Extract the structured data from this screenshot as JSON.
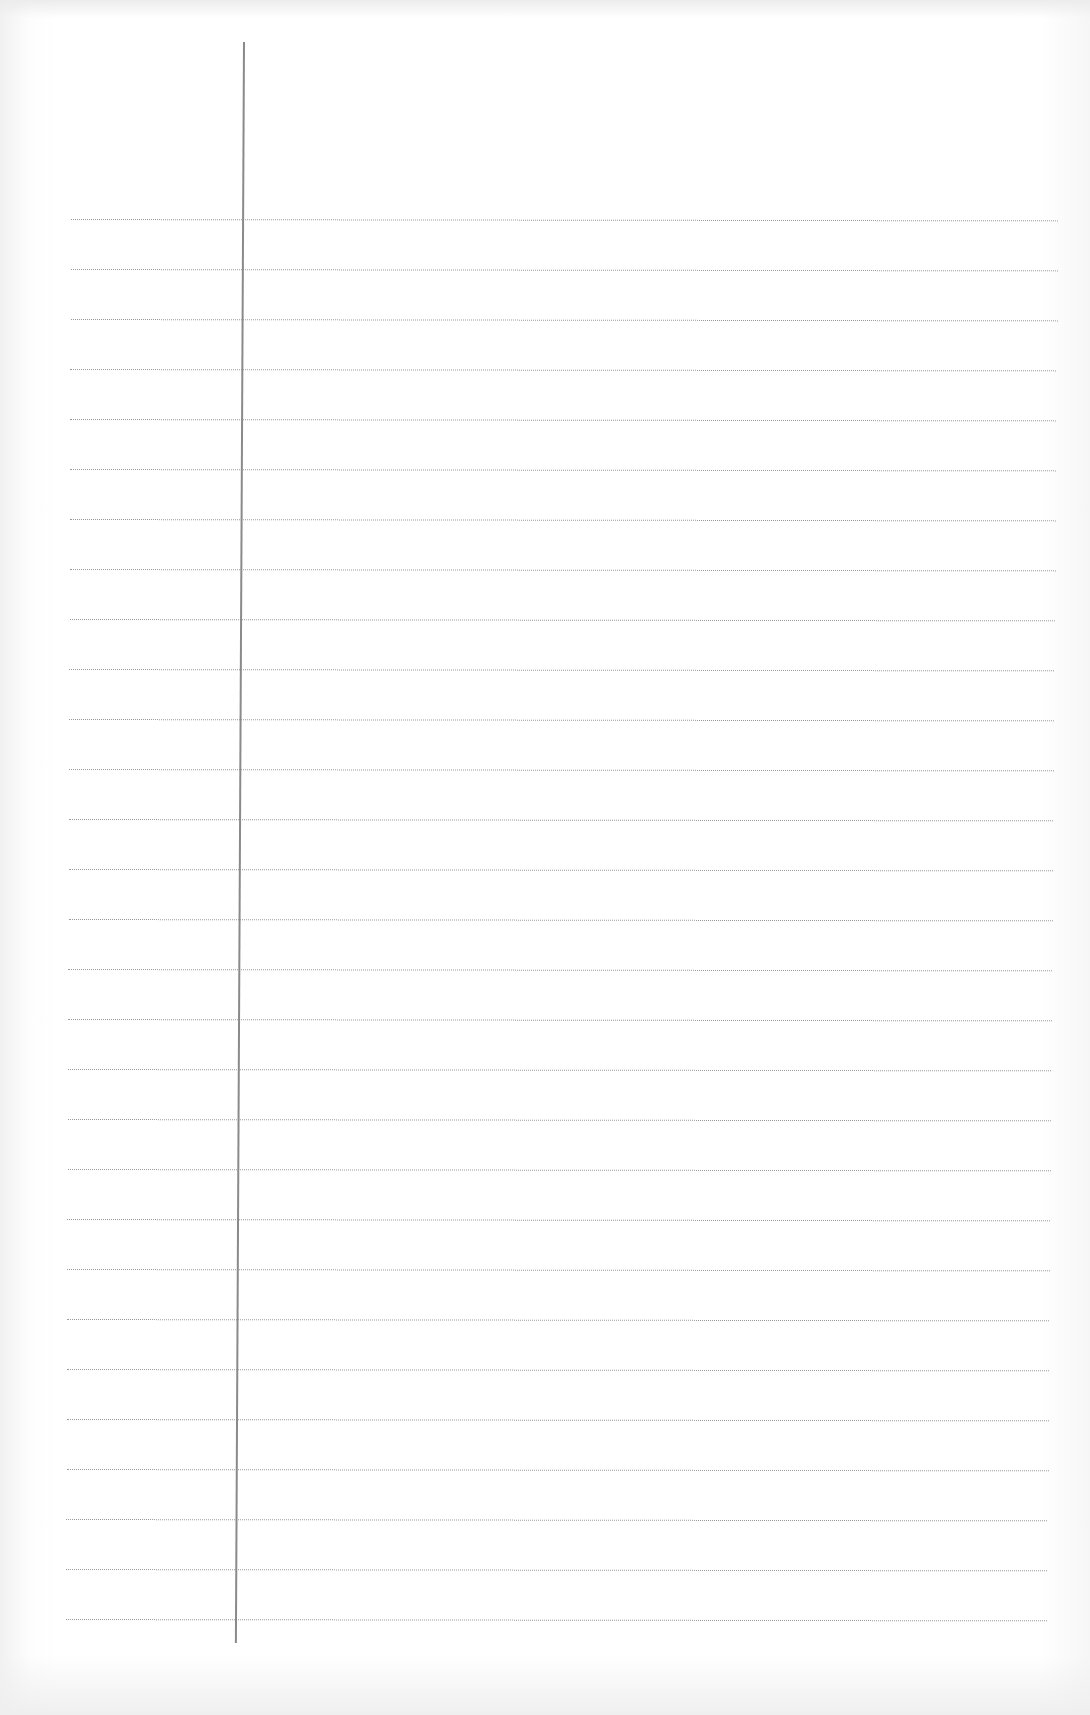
{
  "document": {
    "type": "lined-paper",
    "background_color": "#ffffff",
    "rule_color": "#9a9a9a",
    "margin_line_color": "#8a8a8a",
    "rule_count": 29,
    "rule_spacing_px": 50,
    "first_rule_y": 219,
    "margin_x": 244,
    "text_content": ""
  }
}
